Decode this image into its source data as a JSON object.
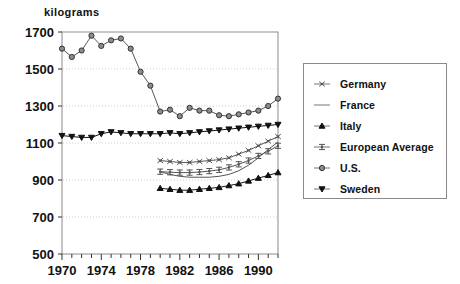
{
  "chart_data": {
    "type": "line",
    "title": "",
    "ylabel": "kilograms",
    "xlabel": "",
    "ylim": [
      500,
      1700
    ],
    "yticks": [
      500,
      700,
      900,
      1100,
      1300,
      1500,
      1700
    ],
    "xlim": [
      1970,
      1992
    ],
    "xticks": [
      1970,
      1974,
      1978,
      1982,
      1986,
      1990
    ],
    "xtick_step_minor": 1,
    "grid": "horizontal-dotted",
    "legend_position": "right-outside",
    "series": [
      {
        "name": "Germany",
        "marker": "asterisk",
        "color": "#555555",
        "x": [
          1980,
          1981,
          1982,
          1983,
          1984,
          1985,
          1986,
          1987,
          1988,
          1989,
          1990,
          1991,
          1992
        ],
        "values": [
          1005,
          1000,
          995,
          995,
          1000,
          1005,
          1010,
          1020,
          1040,
          1060,
          1085,
          1110,
          1135
        ]
      },
      {
        "name": "France",
        "marker": "none",
        "color": "#555555",
        "x": [
          1980,
          1981,
          1982,
          1983,
          1984,
          1985,
          1986,
          1987,
          1988,
          1989,
          1990,
          1991,
          1992
        ],
        "values": [
          945,
          930,
          920,
          915,
          915,
          915,
          920,
          930,
          950,
          980,
          1020,
          1065,
          1105
        ]
      },
      {
        "name": "Italy",
        "marker": "triangle-up",
        "color": "#111111",
        "x": [
          1980,
          1981,
          1982,
          1983,
          1984,
          1985,
          1986,
          1987,
          1988,
          1989,
          1990,
          1991,
          1992
        ],
        "values": [
          855,
          850,
          845,
          845,
          850,
          855,
          860,
          870,
          880,
          895,
          910,
          925,
          940
        ]
      },
      {
        "name": "European Average",
        "marker": "plus-bar",
        "color": "#555555",
        "x": [
          1980,
          1981,
          1982,
          1983,
          1984,
          1985,
          1986,
          1987,
          1988,
          1989,
          1990,
          1991,
          1992
        ],
        "values": [
          945,
          942,
          940,
          940,
          943,
          948,
          955,
          968,
          985,
          1005,
          1030,
          1055,
          1085
        ]
      },
      {
        "name": "U.S.",
        "marker": "circle",
        "color": "#555555",
        "x": [
          1970,
          1971,
          1972,
          1973,
          1974,
          1975,
          1976,
          1977,
          1978,
          1979,
          1980,
          1981,
          1982,
          1983,
          1984,
          1985,
          1986,
          1987,
          1988,
          1989,
          1990,
          1991,
          1992
        ],
        "values": [
          1610,
          1565,
          1600,
          1680,
          1625,
          1655,
          1665,
          1610,
          1485,
          1410,
          1270,
          1280,
          1245,
          1290,
          1275,
          1275,
          1250,
          1245,
          1255,
          1265,
          1275,
          1300,
          1340
        ]
      },
      {
        "name": "Sweden",
        "marker": "triangle-down",
        "color": "#111111",
        "x": [
          1970,
          1971,
          1972,
          1973,
          1974,
          1975,
          1976,
          1977,
          1978,
          1979,
          1980,
          1981,
          1982,
          1983,
          1984,
          1985,
          1986,
          1987,
          1988,
          1989,
          1990,
          1991,
          1992
        ],
        "values": [
          1140,
          1135,
          1130,
          1130,
          1150,
          1160,
          1155,
          1150,
          1150,
          1150,
          1150,
          1155,
          1150,
          1155,
          1160,
          1165,
          1170,
          1175,
          1180,
          1185,
          1190,
          1195,
          1200
        ]
      }
    ]
  },
  "legend": {
    "items": [
      {
        "label": "Germany",
        "marker": "asterisk"
      },
      {
        "label": "France",
        "marker": "none"
      },
      {
        "label": "Italy",
        "marker": "triangle-up"
      },
      {
        "label": "European Average",
        "marker": "plus-bar"
      },
      {
        "label": "U.S.",
        "marker": "circle"
      },
      {
        "label": "Sweden",
        "marker": "triangle-down"
      }
    ]
  }
}
